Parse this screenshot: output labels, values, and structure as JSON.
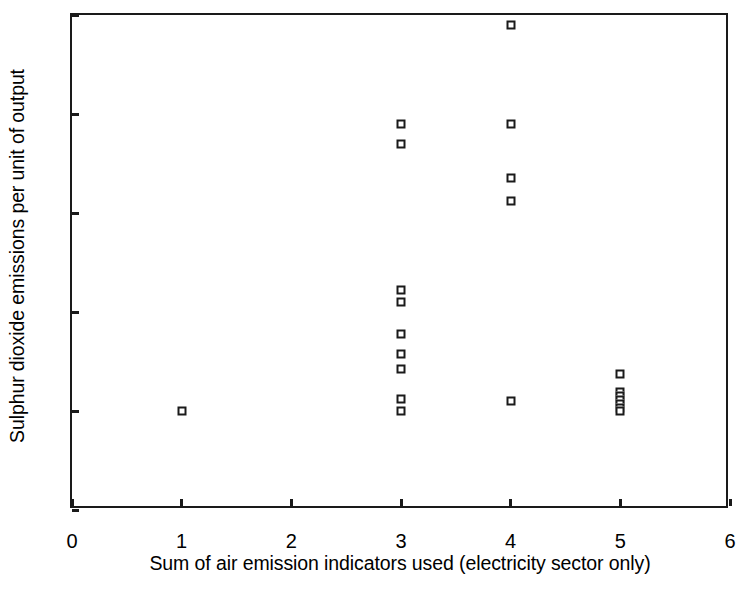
{
  "chart_data": {
    "type": "scatter",
    "title": "",
    "xlabel": "Sum of air emission indicators used (electricity sector only)",
    "ylabel": "Sulphur dioxide emissions per unit of output",
    "xlim": [
      0,
      6
    ],
    "ylim": [
      -2,
      8
    ],
    "xticks": [
      0,
      1,
      2,
      3,
      4,
      5,
      6
    ],
    "yticks": [
      -2,
      0,
      2,
      4,
      6,
      8
    ],
    "xtick_labels": [
      "0",
      "1",
      "2",
      "3",
      "4",
      "5",
      "6"
    ],
    "ytick_labels": [
      "-2",
      "0",
      "2",
      "4",
      "6",
      "8"
    ],
    "grid": false,
    "legend": false,
    "marker": "open-square",
    "marker_color": "#1a1a1a",
    "points": [
      {
        "x": 1,
        "y": 0.0
      },
      {
        "x": 3,
        "y": 5.8
      },
      {
        "x": 3,
        "y": 5.4
      },
      {
        "x": 3,
        "y": 2.45
      },
      {
        "x": 3,
        "y": 2.2
      },
      {
        "x": 3,
        "y": 1.55
      },
      {
        "x": 3,
        "y": 1.15
      },
      {
        "x": 3,
        "y": 0.85
      },
      {
        "x": 3,
        "y": 0.25
      },
      {
        "x": 3,
        "y": 0.0
      },
      {
        "x": 4,
        "y": 7.8
      },
      {
        "x": 4,
        "y": 5.8
      },
      {
        "x": 4,
        "y": 4.7
      },
      {
        "x": 4,
        "y": 4.25
      },
      {
        "x": 4,
        "y": 0.2
      },
      {
        "x": 5,
        "y": 0.75
      },
      {
        "x": 5,
        "y": 0.38
      },
      {
        "x": 5,
        "y": 0.3
      },
      {
        "x": 5,
        "y": 0.22
      },
      {
        "x": 5,
        "y": 0.14
      },
      {
        "x": 5,
        "y": 0.06
      },
      {
        "x": 5,
        "y": 0.0
      }
    ]
  }
}
